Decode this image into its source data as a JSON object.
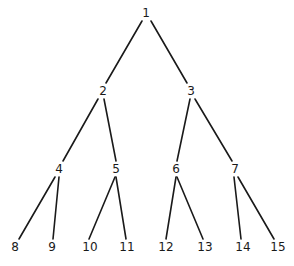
{
  "diagram": {
    "type": "binary-tree",
    "nodes": [
      {
        "id": "1",
        "label": "1",
        "x": 146,
        "y": 13
      },
      {
        "id": "2",
        "label": "2",
        "x": 103,
        "y": 91
      },
      {
        "id": "3",
        "label": "3",
        "x": 191,
        "y": 91
      },
      {
        "id": "4",
        "label": "4",
        "x": 59,
        "y": 169
      },
      {
        "id": "5",
        "label": "5",
        "x": 116,
        "y": 169
      },
      {
        "id": "6",
        "label": "6",
        "x": 176,
        "y": 169
      },
      {
        "id": "7",
        "label": "7",
        "x": 235,
        "y": 169
      },
      {
        "id": "8",
        "label": "8",
        "x": 15,
        "y": 247
      },
      {
        "id": "9",
        "label": "9",
        "x": 52,
        "y": 247
      },
      {
        "id": "10",
        "label": "10",
        "x": 90,
        "y": 247
      },
      {
        "id": "11",
        "label": "11",
        "x": 127,
        "y": 247
      },
      {
        "id": "12",
        "label": "12",
        "x": 166,
        "y": 247
      },
      {
        "id": "13",
        "label": "13",
        "x": 205,
        "y": 247
      },
      {
        "id": "14",
        "label": "14",
        "x": 243,
        "y": 247
      },
      {
        "id": "15",
        "label": "15",
        "x": 278,
        "y": 247
      }
    ],
    "edges": [
      {
        "from": "1",
        "to": "2",
        "x1": 142,
        "y1": 21,
        "x2": 106,
        "y2": 83
      },
      {
        "from": "1",
        "to": "3",
        "x1": 151,
        "y1": 21,
        "x2": 187,
        "y2": 83
      },
      {
        "from": "2",
        "to": "4",
        "x1": 98,
        "y1": 99,
        "x2": 63,
        "y2": 161
      },
      {
        "from": "2",
        "to": "5",
        "x1": 104,
        "y1": 99,
        "x2": 116,
        "y2": 161
      },
      {
        "from": "3",
        "to": "6",
        "x1": 190,
        "y1": 99,
        "x2": 177,
        "y2": 161
      },
      {
        "from": "3",
        "to": "7",
        "x1": 195,
        "y1": 99,
        "x2": 232,
        "y2": 161
      },
      {
        "from": "4",
        "to": "8",
        "x1": 55,
        "y1": 177,
        "x2": 19,
        "y2": 239
      },
      {
        "from": "4",
        "to": "9",
        "x1": 59,
        "y1": 177,
        "x2": 53,
        "y2": 239
      },
      {
        "from": "5",
        "to": "10",
        "x1": 115,
        "y1": 177,
        "x2": 89,
        "y2": 239
      },
      {
        "from": "5",
        "to": "11",
        "x1": 116,
        "y1": 177,
        "x2": 126,
        "y2": 239
      },
      {
        "from": "6",
        "to": "12",
        "x1": 176,
        "y1": 177,
        "x2": 166,
        "y2": 239
      },
      {
        "from": "6",
        "to": "13",
        "x1": 177,
        "y1": 177,
        "x2": 203,
        "y2": 239
      },
      {
        "from": "7",
        "to": "14",
        "x1": 234,
        "y1": 177,
        "x2": 241,
        "y2": 239
      },
      {
        "from": "7",
        "to": "15",
        "x1": 238,
        "y1": 177,
        "x2": 274,
        "y2": 239
      }
    ]
  }
}
